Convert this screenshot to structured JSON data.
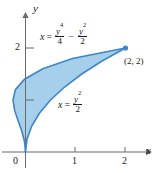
{
  "figure": {
    "name": "area-between-curves-plot",
    "type": "math-graph"
  },
  "chart_data": {
    "type": "line",
    "title": "",
    "xlabel": "x",
    "ylabel": "y",
    "xlim": [
      -0.45,
      2.35
    ],
    "ylim": [
      -0.4,
      2.6
    ],
    "grid": false,
    "legend": "none",
    "xticks": [
      1,
      2
    ],
    "xtick_labels": [
      "1",
      "2"
    ],
    "yticks": [
      1,
      2
    ],
    "ytick_labels": [
      "",
      "2"
    ],
    "origin_label": "0",
    "shaded_region": {
      "fill_color": "#a5cfeb",
      "between": [
        "x = y^4/4 - y^2/2",
        "x = y^2/2"
      ],
      "y_range": [
        0,
        2
      ],
      "description": "Region between the curves from (0,0) to (2,2)"
    },
    "series": [
      {
        "name": "x = y^4/4 - y^2/2",
        "equation_text": "x = y⁴/4 − y²/2",
        "color": "#3d86c6",
        "points": [
          {
            "y": 0.0,
            "x": 0.0
          },
          {
            "y": 0.2,
            "x": -0.0196
          },
          {
            "y": 0.4,
            "x": -0.0736
          },
          {
            "y": 0.6,
            "x": -0.1476
          },
          {
            "y": 0.8,
            "x": -0.2176
          },
          {
            "y": 1.0,
            "x": -0.25
          },
          {
            "y": 1.2,
            "x": -0.2016
          },
          {
            "y": 1.4,
            "x": -0.0196
          },
          {
            "y": 1.6,
            "x": 0.3456
          },
          {
            "y": 1.8,
            "x": 0.9396
          },
          {
            "y": 2.0,
            "x": 2.0
          }
        ]
      },
      {
        "name": "x = y^2/2",
        "equation_text": "x = y²/2",
        "color": "#3d86c6",
        "points": [
          {
            "y": 0.0,
            "x": 0.0
          },
          {
            "y": 0.25,
            "x": 0.03125
          },
          {
            "y": 0.5,
            "x": 0.125
          },
          {
            "y": 0.75,
            "x": 0.28125
          },
          {
            "y": 1.0,
            "x": 0.5
          },
          {
            "y": 1.25,
            "x": 0.78125
          },
          {
            "y": 1.5,
            "x": 1.125
          },
          {
            "y": 1.75,
            "x": 1.53125
          },
          {
            "y": 2.0,
            "x": 2.0
          }
        ]
      }
    ],
    "annotations": [
      {
        "name": "point-label",
        "text": "(2, 2)",
        "x": 2,
        "y": 2,
        "marker": "filled-dot"
      },
      {
        "name": "upper-curve-equation",
        "text": "x = y⁴/4 − y²/2"
      },
      {
        "name": "lower-curve-equation",
        "text": "x = y²/2"
      }
    ]
  },
  "labels": {
    "x_axis_name": "x",
    "y_axis_name": "y",
    "origin": "0",
    "tick_x_1": "1",
    "tick_x_2": "2",
    "tick_y_2": "2",
    "point": "(2, 2)",
    "eq_top": {
      "lhs": "x",
      "eq": "=",
      "num1": "y",
      "num1_exp": "4",
      "den1": "4",
      "minus": "−",
      "num2": "y",
      "num2_exp": "2",
      "den2": "2"
    },
    "eq_bottom": {
      "lhs": "x",
      "eq": "=",
      "num": "y",
      "num_exp": "2",
      "den": "2"
    }
  },
  "colors": {
    "fill": "#a5cfeb",
    "curve": "#3d86c6",
    "axis": "#6b6b6b",
    "text": "#1a1a1a"
  }
}
